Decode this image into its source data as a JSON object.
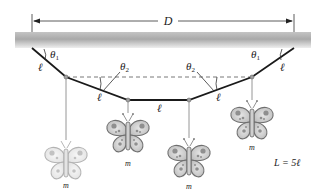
{
  "diagram": {
    "dimension": {
      "label": "D"
    },
    "angles": {
      "theta1": "θ",
      "theta1_sub": "1",
      "theta2": "θ",
      "theta2_sub": "2"
    },
    "segment_label": "ℓ",
    "mass_label": "m",
    "equation": "L = 5ℓ",
    "colors": {
      "ceiling_top": "#b9b9b9",
      "ceiling_bottom": "#f2f2f2",
      "string": "#1a1a1a",
      "hanger": "#8a8a8a",
      "joint": "#9a9a9a"
    },
    "joints": [
      {
        "id": "anchor-left",
        "x": 32,
        "y": 48
      },
      {
        "id": "joint-1",
        "x": 66,
        "y": 77
      },
      {
        "id": "joint-2",
        "x": 128,
        "y": 100
      },
      {
        "id": "joint-3",
        "x": 189,
        "y": 100
      },
      {
        "id": "joint-4",
        "x": 252,
        "y": 77
      },
      {
        "id": "anchor-right",
        "x": 294,
        "y": 48
      }
    ],
    "butterflies": [
      {
        "id": "butterfly-1",
        "x": 66,
        "y": 160,
        "shade": "light",
        "label": "m"
      },
      {
        "id": "butterfly-2",
        "x": 128,
        "y": 133,
        "shade": "medium",
        "label": "m"
      },
      {
        "id": "butterfly-3",
        "x": 189,
        "y": 158,
        "shade": "medium",
        "label": "m"
      },
      {
        "id": "butterfly-4",
        "x": 252,
        "y": 120,
        "shade": "medium",
        "label": "m"
      }
    ]
  }
}
